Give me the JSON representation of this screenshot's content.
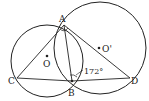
{
  "diagram": {
    "type": "geometry",
    "labels": {
      "A": "A",
      "B": "B",
      "C": "C",
      "D": "D",
      "O": "O",
      "O_prime": "O'"
    },
    "angle_label": "172°",
    "colors": {
      "stroke": "#222222",
      "background": "#ffffff"
    }
  }
}
